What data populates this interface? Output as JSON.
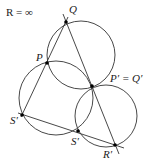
{
  "title": "R = ∞",
  "points": [
    {
      "id": "Q",
      "label": "Q",
      "x": 66,
      "y": 22,
      "lx": 69,
      "ly": 11
    },
    {
      "id": "P",
      "label": "P",
      "x": 47,
      "y": 63,
      "lx": 36,
      "ly": 61
    },
    {
      "id": "PQ",
      "label": "P′ = Q′",
      "x": 92,
      "y": 86,
      "lx": 110,
      "ly": 82
    },
    {
      "id": "S1",
      "label": "S′",
      "x": 22,
      "y": 115,
      "lx": 10,
      "ly": 124
    },
    {
      "id": "S2",
      "label": "S′",
      "x": 78,
      "y": 131,
      "lx": 71,
      "ly": 145
    },
    {
      "id": "R",
      "label": "R′",
      "x": 115,
      "y": 145,
      "lx": 103,
      "ly": 158
    }
  ],
  "circles": [
    {
      "id": "top-circle",
      "cx": 81,
      "cy": 55,
      "r": 34
    },
    {
      "id": "left-circle",
      "cx": 56,
      "cy": 98,
      "r": 37
    },
    {
      "id": "right-circle",
      "cx": 106,
      "cy": 116,
      "r": 31
    }
  ],
  "lines": [
    {
      "id": "line-Q-R",
      "x1": 63,
      "y1": 14,
      "x2": 119,
      "y2": 154
    },
    {
      "id": "line-Q-S",
      "x1": 68,
      "y1": 17,
      "x2": 21,
      "y2": 117
    },
    {
      "id": "line-S-R",
      "x1": 18,
      "y1": 113,
      "x2": 124,
      "y2": 148
    }
  ]
}
